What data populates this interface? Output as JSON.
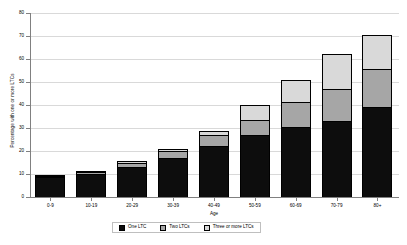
{
  "chart_data": {
    "type": "bar",
    "stacked": true,
    "title": "",
    "xlabel": "Age",
    "ylabel": "Percentage with one or more LTCs",
    "categories": [
      "0-9",
      "10-19",
      "20-29",
      "30-39",
      "40-49",
      "50-59",
      "60-69",
      "70-79",
      "80+"
    ],
    "series": [
      {
        "name": "One LTC",
        "color": "#0d0d0d",
        "values": [
          8.5,
          10.0,
          13.0,
          17.0,
          22.0,
          27.0,
          30.5,
          33.0,
          39.0
        ]
      },
      {
        "name": "Two LTCs",
        "color": "#a6a6a6",
        "values": [
          0.8,
          1.0,
          1.8,
          3.0,
          5.0,
          6.5,
          11.0,
          14.0,
          16.5
        ]
      },
      {
        "name": "Three or more LTCs",
        "color": "#d9d9d9",
        "values": [
          0.3,
          0.4,
          0.7,
          1.0,
          1.5,
          6.5,
          9.5,
          15.0,
          15.0
        ]
      }
    ],
    "totals": [
      9.6,
      11.4,
      15.5,
      21.0,
      28.5,
      40.0,
      51.0,
      62.0,
      70.5
    ],
    "ylim": [
      0,
      80
    ],
    "yticks": [
      0,
      10,
      20,
      30,
      40,
      50,
      60,
      70,
      80
    ],
    "ytick_labels": [
      "0",
      "10",
      "20",
      "30",
      "40",
      "50",
      "60",
      "70",
      "80"
    ],
    "grid": true,
    "legend_position": "bottom"
  },
  "legend": {
    "items": [
      {
        "label": "One LTC",
        "color": "#0d0d0d"
      },
      {
        "label": "Two LTCs",
        "color": "#a6a6a6"
      },
      {
        "label": "Three or more LTCs",
        "color": "#d9d9d9"
      }
    ]
  }
}
